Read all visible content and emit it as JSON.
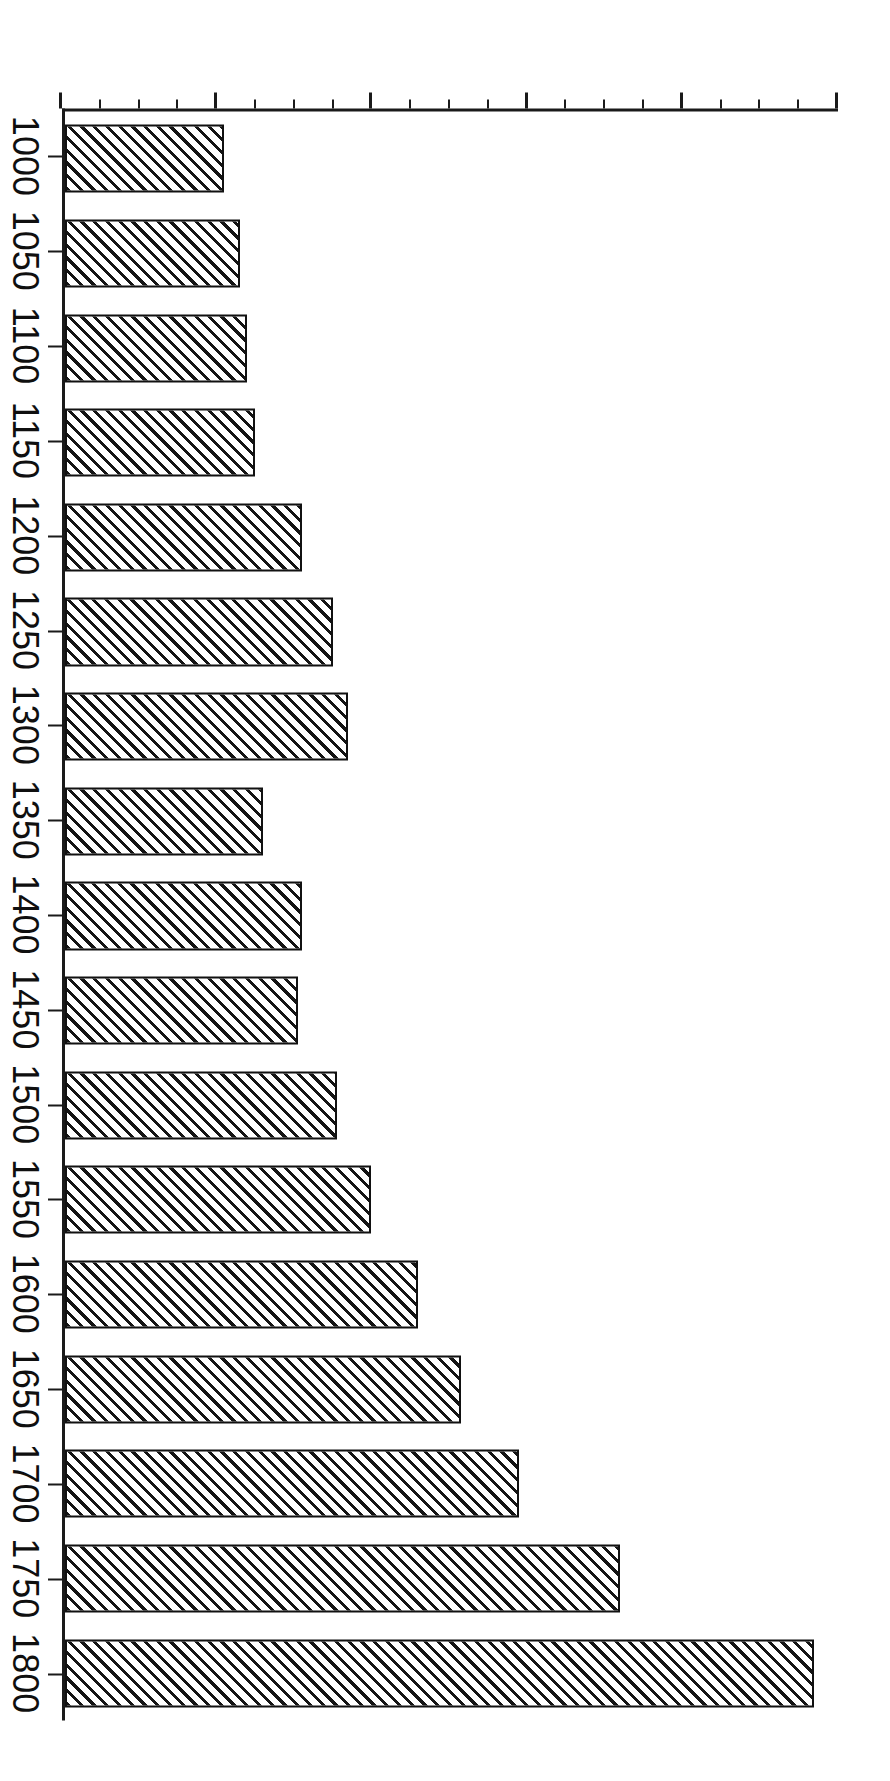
{
  "chart_data": {
    "type": "bar",
    "orientation": "vertical",
    "title": "",
    "subtitle": "",
    "xlabel": "",
    "ylabel": "",
    "categories": [
      "1000",
      "1050",
      "1100",
      "1150",
      "1200",
      "1250",
      "1300",
      "1350",
      "1400",
      "1450",
      "1500",
      "1550",
      "1600",
      "1650",
      "1700",
      "1750",
      "1800"
    ],
    "values": [
      41,
      45,
      47,
      49,
      61,
      69,
      73,
      51,
      61,
      60,
      70,
      79,
      91,
      102,
      117,
      143,
      193
    ],
    "series": [
      {
        "name": "",
        "values": [
          41,
          45,
          47,
          49,
          61,
          69,
          73,
          51,
          61,
          60,
          70,
          79,
          91,
          102,
          117,
          143,
          193
        ]
      }
    ],
    "ylim": [
      0,
      200
    ],
    "ytick_labels": [
      "0",
      "40",
      "80",
      "120",
      "160",
      "200"
    ],
    "ytick_values": [
      0,
      40,
      80,
      120,
      160,
      200
    ],
    "yminor_step": 10,
    "grid": false,
    "legend": null,
    "legend_position": "none",
    "bar_fill": "diagonal-hatch",
    "bar_edge_color": "#111111",
    "bar_fill_color": "#ffffff",
    "axis_color": "#1a1a1a",
    "background_color": "#ffffff",
    "page_rotation_degrees": 90,
    "annotations": []
  }
}
